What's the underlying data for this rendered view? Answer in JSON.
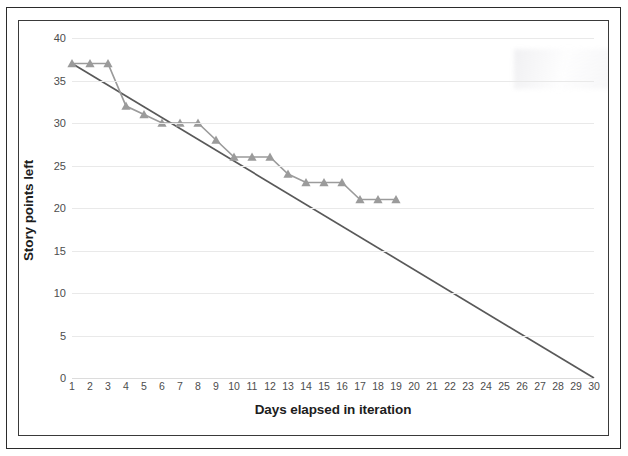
{
  "chart_data": {
    "type": "line",
    "title": "",
    "xlabel": "Days elapsed in iteration",
    "ylabel": "Story points left",
    "x": [
      1,
      2,
      3,
      4,
      5,
      6,
      7,
      8,
      9,
      10,
      11,
      12,
      13,
      14,
      15,
      16,
      17,
      18,
      19,
      20,
      21,
      22,
      23,
      24,
      25,
      26,
      27,
      28,
      29,
      30
    ],
    "xlim": [
      1,
      30
    ],
    "ylim": [
      0,
      40
    ],
    "ytick_labels": [
      "0",
      "5",
      "10",
      "15",
      "20",
      "25",
      "30",
      "35",
      "40"
    ],
    "yticks": [
      0,
      5,
      10,
      15,
      20,
      25,
      30,
      35,
      40
    ],
    "xtick_labels": [
      "1",
      "2",
      "3",
      "4",
      "5",
      "6",
      "7",
      "8",
      "9",
      "10",
      "11",
      "12",
      "13",
      "14",
      "15",
      "16",
      "17",
      "18",
      "19",
      "20",
      "21",
      "22",
      "23",
      "24",
      "25",
      "26",
      "27",
      "28",
      "29",
      "30"
    ],
    "grid": "horizontal",
    "legend": "none",
    "series": [
      {
        "name": "Actual story points remaining",
        "marker": "triangle",
        "color": "#9b9b9b",
        "x": [
          1,
          2,
          3,
          4,
          5,
          6,
          7,
          8,
          9,
          10,
          11,
          12,
          13,
          14,
          15,
          16,
          17,
          18,
          19
        ],
        "values": [
          37,
          37,
          37,
          32,
          31,
          30,
          30,
          30,
          28,
          26,
          26,
          26,
          24,
          23,
          23,
          23,
          21,
          21,
          21
        ]
      },
      {
        "name": "Ideal burndown",
        "marker": "none",
        "color": "#595959",
        "x": [
          1,
          30
        ],
        "values": [
          37,
          0
        ]
      }
    ]
  },
  "axes": {
    "y_title": "Story points left",
    "x_title": "Days elapsed in iteration"
  },
  "colors": {
    "actual_series": "#9b9b9b",
    "ideal_series": "#595959",
    "gridline": "#e9e9e9",
    "frame": "#3a3a3a",
    "page_border": "#2b2b2b",
    "tick_text": "#4d4d4d",
    "title_text": "#1d1d1d"
  }
}
